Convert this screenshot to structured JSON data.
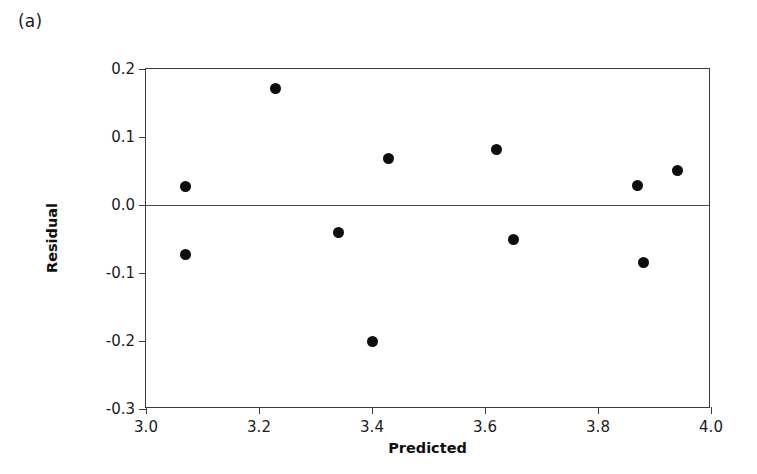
{
  "panel": {
    "label": "(a)"
  },
  "chart_data": {
    "type": "scatter",
    "title": "",
    "subtitle": "",
    "xlabel": "Predicted",
    "ylabel": "Residual",
    "xlim": [
      3.0,
      4.0
    ],
    "ylim": [
      -0.3,
      0.2
    ],
    "xticks": [
      "3.0",
      "3.2",
      "3.4",
      "3.6",
      "3.8",
      "4.0"
    ],
    "xtick_values": [
      3.0,
      3.2,
      3.4,
      3.6,
      3.8,
      4.0
    ],
    "yticks": [
      "0.2",
      "0.1",
      "0.0",
      "-0.1",
      "-0.2",
      "-0.3"
    ],
    "ytick_values": [
      0.2,
      0.1,
      0.0,
      -0.1,
      -0.2,
      -0.3
    ],
    "grid": false,
    "legend": null,
    "reference_lines": [
      {
        "name": "zero-residual-line",
        "axis": "y",
        "value": 0.0
      }
    ],
    "marker": {
      "shape": "circle",
      "filled": true,
      "color": "#0d0d0d",
      "size": 11
    },
    "points": [
      {
        "x": 3.07,
        "y": 0.027
      },
      {
        "x": 3.07,
        "y": -0.073
      },
      {
        "x": 3.23,
        "y": 0.171
      },
      {
        "x": 3.34,
        "y": -0.04
      },
      {
        "x": 3.4,
        "y": -0.201
      },
      {
        "x": 3.43,
        "y": 0.068
      },
      {
        "x": 3.62,
        "y": 0.082
      },
      {
        "x": 3.65,
        "y": -0.051
      },
      {
        "x": 3.87,
        "y": 0.029
      },
      {
        "x": 3.88,
        "y": -0.085
      },
      {
        "x": 3.94,
        "y": 0.051
      }
    ]
  },
  "colors": {
    "marker": "#0d0d0d",
    "axis": "#3b3b3b",
    "background": "#ffffff"
  }
}
